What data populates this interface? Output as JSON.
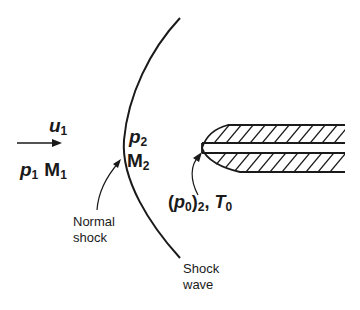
{
  "diagram": {
    "type": "pitot-probe-supersonic-flow",
    "upstream": {
      "velocity": {
        "base": "u",
        "sub": "1"
      },
      "pressure": {
        "base": "p",
        "sub": "1"
      },
      "mach": {
        "base": "M",
        "sub": "1"
      }
    },
    "downstream": {
      "pressure": {
        "base": "p",
        "sub": "2"
      },
      "mach": {
        "base": "M",
        "sub": "2"
      }
    },
    "probe_label": {
      "open": "(",
      "base": "p",
      "sub0": "0",
      "close": ")",
      "sub2": "2",
      "sep": ", ",
      "tbase": "T",
      "tsub": "0"
    },
    "annotations": {
      "normal_shock": [
        "Normal",
        "shock"
      ],
      "shock_wave": [
        "Shock",
        "wave"
      ]
    },
    "colors": {
      "ink": "#1a1a1a",
      "background": "#ffffff"
    }
  }
}
